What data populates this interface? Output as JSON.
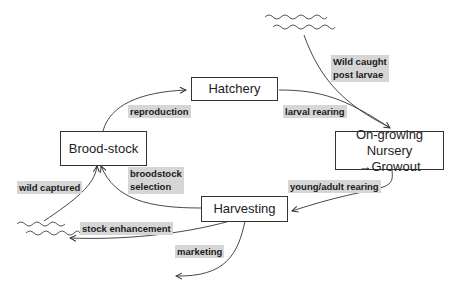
{
  "diagram": {
    "title": "",
    "nodes": {
      "hatchery": "Hatchery",
      "broodstock": "Brood-stock",
      "ongrowing_line1": "On-growing",
      "ongrowing_line2": "Nursery →Growout",
      "harvesting": "Harvesting"
    },
    "edge_labels": {
      "reproduction": "reproduction",
      "larval_rearing": "larval rearing",
      "wild_caught_line1": "Wild caught",
      "wild_caught_line2": "post larvae",
      "young_adult_rearing": "young/adult rearing",
      "broodstock_selection_line1": "broodstock",
      "broodstock_selection_line2": "selection",
      "wild_captured": "wild captured",
      "stock_enhancement": "stock enhancement",
      "marketing": "marketing"
    },
    "edges": [
      {
        "from": "Brood-stock",
        "to": "Hatchery",
        "label": "reproduction"
      },
      {
        "from": "Hatchery",
        "to": "On-growing",
        "label": "larval rearing"
      },
      {
        "from": "wild (water)",
        "to": "On-growing",
        "label": "Wild caught post larvae"
      },
      {
        "from": "On-growing",
        "to": "Harvesting",
        "label": "young/adult rearing"
      },
      {
        "from": "Harvesting",
        "to": "Brood-stock",
        "label": "broodstock selection"
      },
      {
        "from": "wild (water)",
        "to": "Brood-stock",
        "label": "wild captured"
      },
      {
        "from": "Harvesting",
        "to": "wild (water)",
        "label": "stock enhancement"
      },
      {
        "from": "Harvesting",
        "to": "market",
        "label": "marketing"
      }
    ],
    "colors": {
      "label_background": "#d6d6d6",
      "line": "#333333"
    }
  }
}
